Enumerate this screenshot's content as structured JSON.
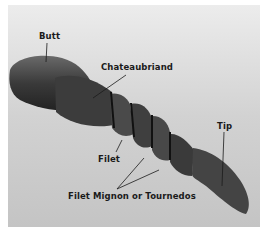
{
  "figure": {
    "labels": {
      "butt": "Butt",
      "chateaubriand": "Chateaubriand",
      "filet": "Filet",
      "filet_mignon": "Filet Mignon or Tournedos",
      "tip": "Tip"
    }
  }
}
